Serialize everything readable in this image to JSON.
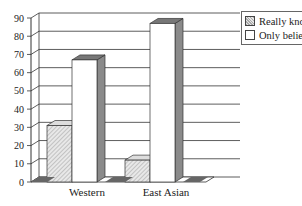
{
  "chart_data": {
    "type": "bar",
    "style": "3d-clustered",
    "title": "",
    "xlabel": "",
    "ylabel": "",
    "categories": [
      "Western",
      "East Asian"
    ],
    "series": [
      {
        "name": "Really knows",
        "values": [
          31,
          12
        ],
        "fill": "hatched-gray"
      },
      {
        "name": "Only believes",
        "values": [
          67,
          87
        ],
        "fill": "white"
      }
    ],
    "ylim": [
      0,
      90
    ],
    "yticks": [
      0,
      10,
      20,
      30,
      40,
      50,
      60,
      70,
      80,
      90
    ],
    "grid": true,
    "legend_position": "top-right"
  },
  "legend": {
    "items": [
      {
        "label": "Really knows"
      },
      {
        "label": "Only believes"
      }
    ]
  },
  "axis": {
    "ticks": [
      "0",
      "10",
      "20",
      "30",
      "40",
      "50",
      "60",
      "70",
      "80",
      "90"
    ],
    "categories": [
      "Western",
      "East Asian"
    ]
  }
}
